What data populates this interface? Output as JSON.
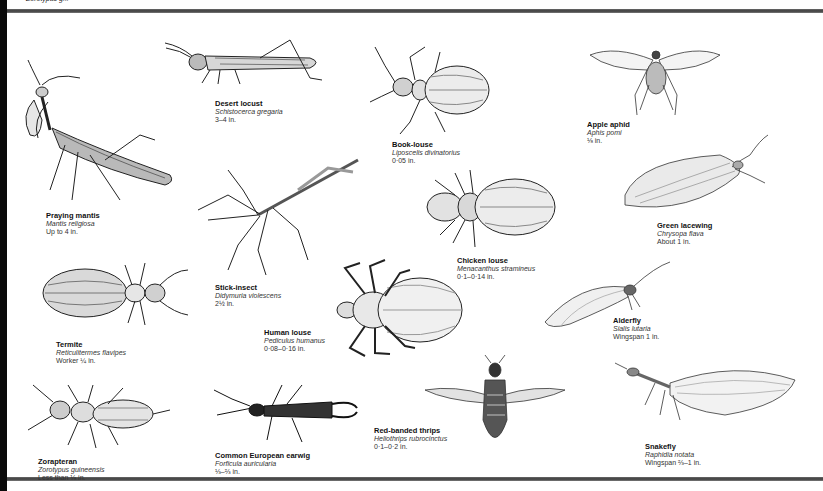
{
  "page": {
    "top_caption": "Zorotypus g...",
    "border_color": "#4a4a4a"
  },
  "species": [
    {
      "common": "Praying mantis",
      "scientific": "Mantis religiosa",
      "size": "Up to 4 in."
    },
    {
      "common": "Desert locust",
      "scientific": "Schistocerca gregaria",
      "size": "3–4 in."
    },
    {
      "common": "Book-louse",
      "scientific": "Liposcelis divinatorius",
      "size": "0·05 in."
    },
    {
      "common": "Apple aphid",
      "scientific": "Aphis pomi",
      "size": "⅛ in."
    },
    {
      "common": "Green lacewing",
      "scientific": "Chrysopa flava",
      "size": "About 1 in."
    },
    {
      "common": "Stick-insect",
      "scientific": "Didymuria violescens",
      "size": "2½ in."
    },
    {
      "common": "Chicken louse",
      "scientific": "Menacanthus stramineus",
      "size": "0·1–0·14 in."
    },
    {
      "common": "Termite",
      "scientific": "Reticulitermes flavipes",
      "size": "Worker ¼ in."
    },
    {
      "common": "Human louse",
      "scientific": "Pediculus humanus",
      "size": "0·08–0·16 in."
    },
    {
      "common": "Alderfly",
      "scientific": "Sialis lutaria",
      "size": "Wingspan 1 in."
    },
    {
      "common": "Zorapteran",
      "scientific": "Zorotypus guineensis",
      "size": "Less than ⅛ in."
    },
    {
      "common": "Common European earwig",
      "scientific": "Forficula auricularia",
      "size": "⅓–⅔ in."
    },
    {
      "common": "Red-banded thrips",
      "scientific": "Heliothrips rubrocinctus",
      "size": "0·1–0·2 in."
    },
    {
      "common": "Snakefly",
      "scientific": "Raphidia notata",
      "size": "Wingspan ⅔–1 in."
    }
  ]
}
